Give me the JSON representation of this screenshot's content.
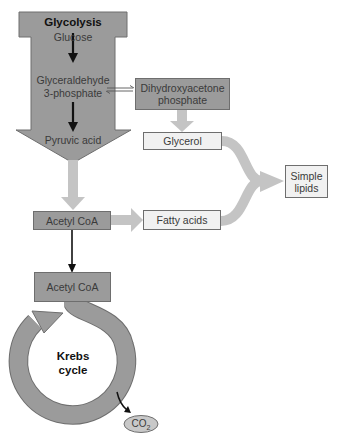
{
  "diagram": {
    "title": "Glycolysis",
    "glycolysis": {
      "title": "Glycolysis",
      "steps": [
        "Glucose",
        "Glyceraldehyde\n3-phosphate",
        "Pyruvic acid"
      ]
    },
    "nodes": {
      "dhap": "Dihydroxyacetone phosphate",
      "glycerol": "Glycerol",
      "simple_lipids": "Simple lipids",
      "acetyl_coa_top": "Acetyl CoA",
      "fatty_acids": "Fatty acids",
      "acetyl_coa_bottom": "Acetyl CoA",
      "krebs": "Krebs cycle",
      "co2_main": "CO",
      "co2_sub": "2"
    },
    "labels": {
      "glucose": "Glucose",
      "g3p_line1": "Glyceraldehyde",
      "g3p_line2": "3-phosphate",
      "pyruvic": "Pyruvic acid",
      "krebs_line1": "Krebs",
      "krebs_line2": "cycle",
      "simple_line1": "Simple",
      "simple_line2": "lipids",
      "dhap_line1": "Dihydroxyacetone",
      "dhap_line2": "phosphate"
    },
    "colors": {
      "dark_fill": "#9b9b9b",
      "light_fill": "#f1f1f1",
      "connector": "#c4c4c4",
      "arrow": "#111111"
    }
  }
}
